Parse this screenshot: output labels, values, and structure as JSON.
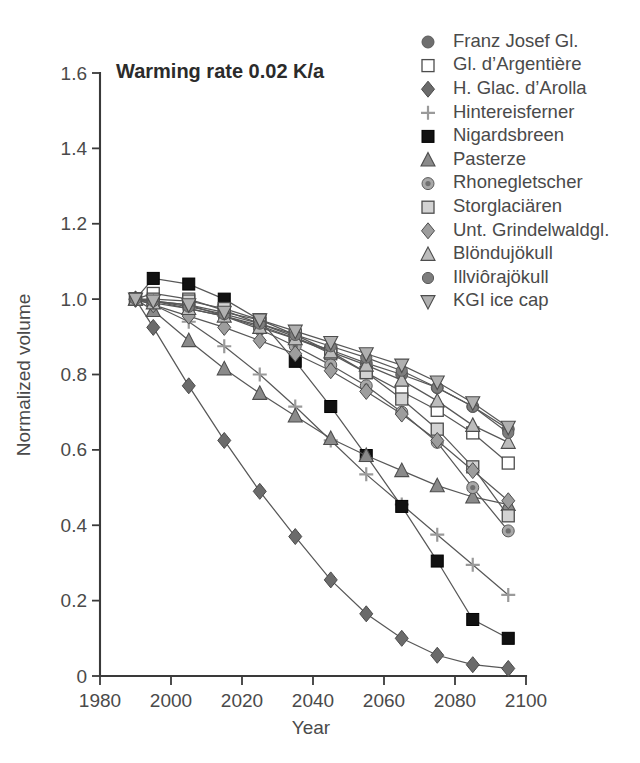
{
  "chart_data": {
    "type": "line",
    "title": "Warming rate 0.02 K/a",
    "xlabel": "Year",
    "ylabel": "Normalized volume",
    "xlim": [
      1980,
      2100
    ],
    "ylim": [
      0,
      1.6
    ],
    "xticks": [
      "1980",
      "2000",
      "2020",
      "2040",
      "2060",
      "2080",
      "2100"
    ],
    "yticks": [
      "0",
      "0.2",
      "0.4",
      "0.6",
      "0.8",
      "1.0",
      "1.2",
      "1.4",
      "1.6"
    ],
    "grid": false,
    "legend_position": "top-right",
    "x": [
      1990,
      1995,
      2005,
      2015,
      2025,
      2035,
      2045,
      2055,
      2065,
      2075,
      2085,
      2095
    ],
    "series": [
      {
        "name": "Franz Josef Gl.",
        "marker": "circle-filled",
        "color": "#6e6e6e",
        "values": [
          1.0,
          0.995,
          0.975,
          0.955,
          0.93,
          0.895,
          0.865,
          0.83,
          0.8,
          0.765,
          0.715,
          0.655
        ]
      },
      {
        "name": "Gl. d’Argentière",
        "marker": "square-open",
        "color": "#ffffff",
        "values": [
          1.0,
          1.015,
          1.0,
          0.97,
          0.935,
          0.9,
          0.855,
          0.805,
          0.755,
          0.705,
          0.645,
          0.565
        ]
      },
      {
        "name": "H. Glac. d’Arolla",
        "marker": "diamond-filled",
        "color": "#6b6b6b",
        "values": [
          1.0,
          0.925,
          0.77,
          0.625,
          0.49,
          0.37,
          0.255,
          0.165,
          0.1,
          0.055,
          0.03,
          0.02
        ]
      },
      {
        "name": "Hintereisferner",
        "marker": "plus",
        "color": "#9a9a9a",
        "values": [
          1.0,
          0.985,
          0.94,
          0.875,
          0.8,
          0.715,
          0.625,
          0.535,
          0.455,
          0.375,
          0.295,
          0.215
        ]
      },
      {
        "name": "Nigardsbreen",
        "marker": "square-filled",
        "color": "#111111",
        "values": [
          1.0,
          1.055,
          1.04,
          1.0,
          0.945,
          0.835,
          0.715,
          0.585,
          0.45,
          0.305,
          0.15,
          0.1
        ]
      },
      {
        "name": "Pasterze",
        "marker": "triangle-up-gray",
        "color": "#8a8a8a",
        "values": [
          1.0,
          0.97,
          0.89,
          0.815,
          0.75,
          0.69,
          0.63,
          0.585,
          0.545,
          0.505,
          0.475,
          0.455
        ]
      },
      {
        "name": "Rhonegletscher",
        "marker": "circle-small",
        "color": "#8c8c8c",
        "values": [
          1.0,
          0.995,
          0.985,
          0.955,
          0.92,
          0.875,
          0.825,
          0.77,
          0.7,
          0.62,
          0.5,
          0.385
        ]
      },
      {
        "name": "Storglaciären",
        "marker": "square-lightgray",
        "color": "#d3d3d3",
        "values": [
          1.0,
          1.0,
          0.995,
          0.975,
          0.945,
          0.905,
          0.86,
          0.805,
          0.735,
          0.655,
          0.555,
          0.425
        ]
      },
      {
        "name": "Unt. Grindelwaldgl.",
        "marker": "diamond-gray",
        "color": "#9d9d9d",
        "values": [
          1.0,
          0.985,
          0.955,
          0.925,
          0.89,
          0.855,
          0.81,
          0.755,
          0.695,
          0.625,
          0.545,
          0.465
        ]
      },
      {
        "name": "Blöndujökull",
        "marker": "triangle-up-light",
        "color": "#bcbcbc",
        "values": [
          1.0,
          0.99,
          0.975,
          0.955,
          0.925,
          0.895,
          0.86,
          0.825,
          0.785,
          0.73,
          0.665,
          0.62
        ]
      },
      {
        "name": "Illviôrajökull",
        "marker": "circle-midgray",
        "color": "#7d7d7d",
        "values": [
          1.0,
          0.995,
          0.98,
          0.96,
          0.935,
          0.905,
          0.875,
          0.845,
          0.81,
          0.765,
          0.715,
          0.645
        ]
      },
      {
        "name": "KGI ice cap",
        "marker": "triangle-down",
        "color": "#b0b0b0",
        "values": [
          1.0,
          0.995,
          0.985,
          0.965,
          0.945,
          0.915,
          0.885,
          0.855,
          0.825,
          0.78,
          0.725,
          0.66
        ]
      }
    ]
  }
}
